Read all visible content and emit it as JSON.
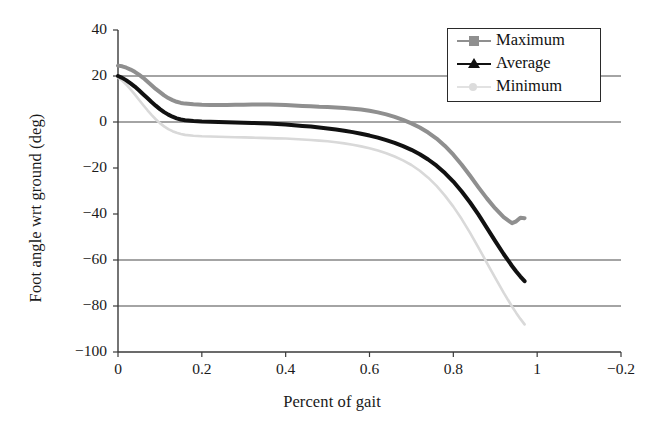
{
  "chart_data": {
    "type": "line",
    "title": "",
    "xlabel": "Percent of gait",
    "ylabel": "Foot angle wrt ground (deg)",
    "xlim": [
      0,
      1.2
    ],
    "ylim": [
      -100,
      40
    ],
    "xticks": [
      "0",
      "0.2",
      "0.4",
      "0.6",
      "0.8",
      "1",
      "−0.2"
    ],
    "xtick_values": [
      0,
      0.2,
      0.4,
      0.6,
      0.8,
      1,
      1.2
    ],
    "yticks": [
      "40",
      "20",
      "0",
      "−20",
      "−40",
      "−60",
      "−80",
      "−100"
    ],
    "ytick_values": [
      40,
      20,
      0,
      -20,
      -40,
      -60,
      -80,
      -100
    ],
    "grid": "horizontal gridlines at 20, 0, -60, -80",
    "gridline_values": [
      20,
      0,
      -60,
      -80
    ],
    "legend_position": "top right",
    "x": [
      0,
      0.01,
      0.02,
      0.03,
      0.04,
      0.05,
      0.06,
      0.07,
      0.08,
      0.09,
      0.1,
      0.11,
      0.12,
      0.13,
      0.14,
      0.15,
      0.16,
      0.18,
      0.2,
      0.22,
      0.24,
      0.26,
      0.28,
      0.3,
      0.32,
      0.34,
      0.36,
      0.38,
      0.4,
      0.42,
      0.44,
      0.46,
      0.48,
      0.5,
      0.52,
      0.54,
      0.56,
      0.58,
      0.6,
      0.62,
      0.64,
      0.66,
      0.68,
      0.7,
      0.72,
      0.74,
      0.76,
      0.78,
      0.8,
      0.82,
      0.84,
      0.86,
      0.88,
      0.9,
      0.92,
      0.94,
      0.95,
      0.96,
      0.97
    ],
    "series": [
      {
        "name": "Maximum",
        "color": "#8f8f8f",
        "marker": "square",
        "values": [
          24.5,
          24.2,
          23.6,
          22.8,
          21.8,
          20.6,
          19.2,
          17.6,
          16.0,
          14.4,
          13.0,
          11.6,
          10.4,
          9.5,
          8.8,
          8.3,
          8.0,
          7.7,
          7.5,
          7.4,
          7.4,
          7.4,
          7.5,
          7.5,
          7.6,
          7.6,
          7.6,
          7.5,
          7.4,
          7.2,
          7.0,
          6.8,
          6.6,
          6.5,
          6.3,
          6.1,
          5.8,
          5.4,
          4.9,
          4.2,
          3.3,
          2.2,
          0.9,
          -0.6,
          -2.4,
          -4.6,
          -7.2,
          -10.4,
          -14.2,
          -18.6,
          -23.4,
          -28.4,
          -33.2,
          -37.6,
          -41.4,
          -44.0,
          -43.2,
          -41.6,
          -41.8
        ]
      },
      {
        "name": "Average",
        "color": "#111111",
        "marker": "triangle",
        "values": [
          20.0,
          19.2,
          18.1,
          16.8,
          15.4,
          13.8,
          12.1,
          10.4,
          8.7,
          7.1,
          5.6,
          4.3,
          3.2,
          2.3,
          1.6,
          1.1,
          0.8,
          0.4,
          0.2,
          0.1,
          0.0,
          -0.1,
          -0.2,
          -0.3,
          -0.4,
          -0.5,
          -0.7,
          -0.9,
          -1.1,
          -1.4,
          -1.7,
          -2.0,
          -2.4,
          -2.8,
          -3.3,
          -3.8,
          -4.4,
          -5.1,
          -5.9,
          -6.8,
          -7.9,
          -9.1,
          -10.5,
          -12.1,
          -14.0,
          -16.3,
          -19.0,
          -22.2,
          -25.9,
          -30.2,
          -35.0,
          -40.3,
          -46.0,
          -51.8,
          -57.4,
          -62.6,
          -65.0,
          -67.2,
          -69.2
        ]
      },
      {
        "name": "Minimum",
        "color": "#d9d9d9",
        "marker": "dot",
        "values": [
          19.4,
          18.0,
          16.2,
          14.2,
          12.0,
          9.7,
          7.4,
          5.2,
          3.1,
          1.2,
          -0.5,
          -1.9,
          -3.1,
          -4.0,
          -4.7,
          -5.2,
          -5.6,
          -6.0,
          -6.2,
          -6.3,
          -6.4,
          -6.5,
          -6.6,
          -6.7,
          -6.8,
          -6.9,
          -7.0,
          -7.1,
          -7.2,
          -7.4,
          -7.6,
          -7.8,
          -8.1,
          -8.4,
          -8.8,
          -9.3,
          -9.9,
          -10.6,
          -11.4,
          -12.4,
          -13.6,
          -15.0,
          -16.7,
          -18.7,
          -21.2,
          -24.2,
          -27.8,
          -32.0,
          -36.8,
          -42.2,
          -48.2,
          -54.6,
          -61.2,
          -67.8,
          -74.2,
          -80.2,
          -83.0,
          -85.6,
          -88.0
        ]
      }
    ]
  }
}
